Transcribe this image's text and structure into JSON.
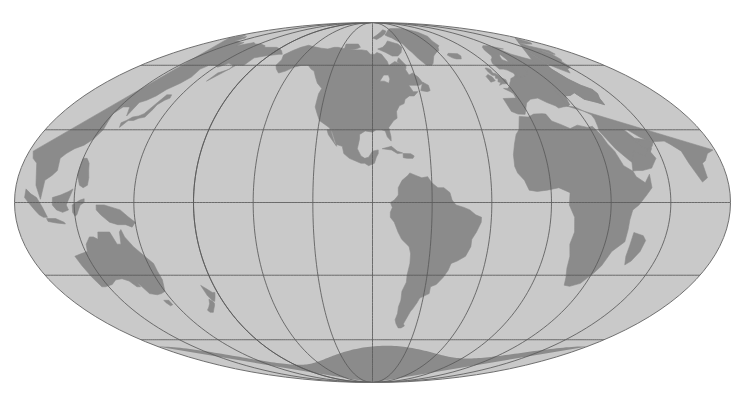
{
  "map": {
    "title": "World Map",
    "projection": "mollweide",
    "projection_label": "Mollweide",
    "center_longitude": -90,
    "center_latitude": 0,
    "graticule_longitude_step": 30,
    "graticule_latitude_step": 30,
    "longitude_range": [
      -180,
      180
    ],
    "latitude_range": [
      -90,
      90
    ],
    "colors": {
      "background": "#ffffff",
      "ocean": "#c9c9c9",
      "land": "#8b8b8b",
      "land_interior": "#9e9e9e",
      "graticule": "#5a5a5a",
      "outline": "#6e6e6e"
    },
    "geometry": {
      "center_x": 372.5,
      "center_y": 202.5,
      "radius_x": 358.0,
      "radius_y": 180.0
    },
    "meridian_labels": [
      "180°",
      "150°W",
      "120°W",
      "90°W",
      "60°W",
      "30°W",
      "0°",
      "30°E",
      "60°E",
      "90°E",
      "120°E",
      "150°E",
      "180°"
    ],
    "parallel_labels": [
      "90°N",
      "60°N",
      "30°N",
      "0°",
      "30°S",
      "60°S",
      "90°S"
    ],
    "continents": [
      "North America",
      "South America",
      "Africa",
      "Europe",
      "Asia",
      "Australia",
      "Antarctica",
      "Greenland"
    ]
  }
}
